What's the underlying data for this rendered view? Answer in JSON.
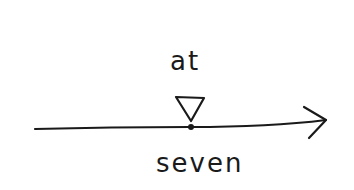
{
  "diagram": {
    "type": "timeline-point",
    "label_above": "at",
    "label_below": "seven",
    "marker": "triangle-pointing-down",
    "axis": "arrow-right",
    "stroke_color": "#1a1a1a",
    "background_color": "#ffffff"
  }
}
